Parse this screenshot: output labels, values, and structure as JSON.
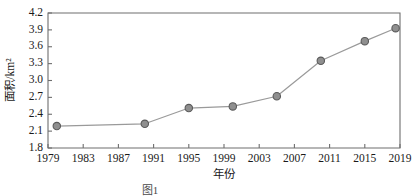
{
  "chart_data": {
    "type": "line",
    "title": "",
    "xlabel": "年份",
    "ylabel": "面积/km²",
    "xlim": [
      1979,
      2019
    ],
    "ylim": [
      1.8,
      4.2
    ],
    "grid": false,
    "legend": null,
    "x_ticks": [
      "1979",
      "1983",
      "1987",
      "1991",
      "1995",
      "1999",
      "2003",
      "2007",
      "2011",
      "2015",
      "2019"
    ],
    "x_tick_values": [
      1979,
      1983,
      1987,
      1991,
      1995,
      1999,
      2003,
      2007,
      2011,
      2015,
      2019
    ],
    "y_ticks": [
      "1.8",
      "2.1",
      "2.4",
      "2.7",
      "3.0",
      "3.3",
      "3.6",
      "3.9",
      "4.2"
    ],
    "y_tick_values": [
      1.8,
      2.1,
      2.4,
      2.7,
      3.0,
      3.3,
      3.6,
      3.9,
      4.2
    ],
    "series": [
      {
        "name": "面积",
        "x": [
          1980,
          1990,
          1995,
          2000,
          2005,
          2010,
          2015,
          2018.5
        ],
        "values": [
          2.19,
          2.23,
          2.51,
          2.54,
          2.72,
          3.35,
          3.7,
          3.93
        ],
        "marker": "circle",
        "marker_color": "#8f8f8f",
        "line_color": "#9a9a9a"
      }
    ]
  },
  "figure": {
    "caption": "图1"
  },
  "colors": {
    "axis": "#6e6e6e",
    "text": "#1a1a1a",
    "marker_fill": "#8f8f8f",
    "marker_edge": "#5a5a5a",
    "line": "#9a9a9a",
    "background": "#ffffff"
  }
}
